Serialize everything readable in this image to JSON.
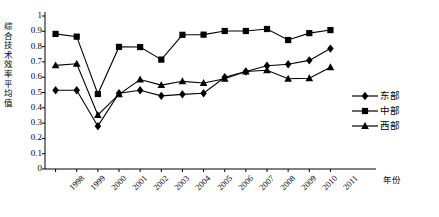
{
  "chart_data": {
    "type": "line",
    "title": "",
    "xlabel": "年份",
    "ylabel": "综合技术效率平均值",
    "categories": [
      "1998",
      "1999",
      "2000",
      "2001",
      "2002",
      "2003",
      "2004",
      "2005",
      "2006",
      "2007",
      "2008",
      "2009",
      "2010",
      "2011"
    ],
    "ylim": [
      0,
      1
    ],
    "ytick_labels": [
      "0",
      "0.1",
      "0.2",
      "0.3",
      "0.4",
      "0.5",
      "0.6",
      "0.7",
      "0.8",
      "0.9",
      "1"
    ],
    "ytick_values": [
      0,
      0.1,
      0.2,
      0.3,
      0.4,
      0.5,
      0.6,
      0.7,
      0.8,
      0.9,
      1
    ],
    "grid": false,
    "legend_position": "right",
    "series": [
      {
        "name": "东部",
        "marker": "diamond",
        "values": [
          0.515,
          0.515,
          0.28,
          0.495,
          0.515,
          0.478,
          0.488,
          0.495,
          0.6,
          0.637,
          0.675,
          0.685,
          0.71,
          0.787
        ]
      },
      {
        "name": "中部",
        "marker": "square",
        "values": [
          0.883,
          0.865,
          0.49,
          0.798,
          0.797,
          0.715,
          0.877,
          0.878,
          0.902,
          0.902,
          0.915,
          0.843,
          0.888,
          0.908
        ]
      },
      {
        "name": "西部",
        "marker": "triangle",
        "values": [
          0.677,
          0.688,
          0.353,
          0.488,
          0.585,
          0.548,
          0.573,
          0.562,
          0.59,
          0.637,
          0.645,
          0.59,
          0.593,
          0.665
        ]
      }
    ]
  },
  "legend": {
    "items": [
      {
        "label": "东部",
        "marker": "diamond"
      },
      {
        "label": "中部",
        "marker": "square"
      },
      {
        "label": "西部",
        "marker": "triangle"
      }
    ]
  },
  "axes": {
    "y_title": "综合技术效率平均值",
    "y_title_chars": [
      "综",
      "合",
      "技",
      "术",
      "效",
      "率",
      "平",
      "均",
      "值"
    ],
    "x_title": "年份"
  },
  "colors": {
    "line": "#000000",
    "marker": "#000000",
    "axis": "#000000",
    "background": "#ffffff"
  }
}
